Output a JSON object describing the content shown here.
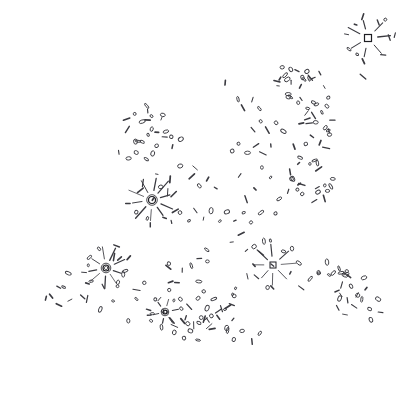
{
  "artwork": {
    "title": "Scattered Mark Field",
    "kind": "abstract-line-art",
    "width": 410,
    "height": 395,
    "background_color": "#ffffff",
    "stroke_color": "#3a3a40",
    "stroke_color_dark": "#1d1d22",
    "stroke_width": 0.9,
    "description": "Hand-drawn scattered field of small ellipses, dashes and dots forming a diagonal band from lower-left to upper-right, punctuated by five radial burst clusters."
  },
  "chart_data": {
    "type": "scatter",
    "xlabel": "",
    "ylabel": "",
    "xlim": [
      0,
      410
    ],
    "ylim": [
      0,
      395
    ],
    "grid": false,
    "legend": false,
    "bursts": [
      {
        "id": "burst-top-right",
        "cx": 368,
        "cy": 38,
        "rays": 7,
        "ray_len": 15,
        "core": "square",
        "core_size": 7
      },
      {
        "id": "burst-center-left",
        "cx": 152,
        "cy": 200,
        "rays": 10,
        "ray_len": 16,
        "core": "ring",
        "core_size": 7
      },
      {
        "id": "burst-lower-left",
        "cx": 106,
        "cy": 268,
        "rays": 9,
        "ray_len": 14,
        "core": "ring",
        "core_size": 6
      },
      {
        "id": "burst-lower-right",
        "cx": 273,
        "cy": 265,
        "rays": 8,
        "ray_len": 17,
        "core": "solid",
        "core_size": 6
      },
      {
        "id": "burst-small-bottom",
        "cx": 165,
        "cy": 312,
        "rays": 6,
        "ray_len": 7,
        "core": "ring",
        "core_size": 4
      }
    ],
    "clusters": [
      {
        "id": "cluster-upper-mid",
        "cx": 295,
        "cy": 85,
        "count": 16,
        "spread": 22
      },
      {
        "id": "cluster-upper-right-rings",
        "cx": 318,
        "cy": 118,
        "count": 10,
        "spread": 20
      },
      {
        "id": "cluster-left-mid",
        "cx": 145,
        "cy": 130,
        "count": 16,
        "spread": 30
      },
      {
        "id": "cluster-right-mid",
        "cx": 312,
        "cy": 175,
        "count": 14,
        "spread": 26
      },
      {
        "id": "cluster-bottom-mid",
        "cx": 195,
        "cy": 290,
        "count": 30,
        "spread": 42
      },
      {
        "id": "cluster-bottom-right",
        "cx": 338,
        "cy": 285,
        "count": 14,
        "spread": 24
      }
    ],
    "points": [
      [
        368,
        38
      ],
      [
        379,
        22
      ],
      [
        355,
        24
      ],
      [
        347,
        34
      ],
      [
        345,
        50
      ],
      [
        358,
        54
      ],
      [
        375,
        52
      ],
      [
        389,
        38
      ],
      [
        362,
        76
      ],
      [
        225,
        83
      ],
      [
        232,
        92
      ],
      [
        239,
        100
      ],
      [
        278,
        92
      ],
      [
        286,
        75
      ],
      [
        292,
        83
      ],
      [
        297,
        70
      ],
      [
        301,
        87
      ],
      [
        288,
        97
      ],
      [
        283,
        102
      ],
      [
        276,
        82
      ],
      [
        293,
        95
      ],
      [
        305,
        80
      ],
      [
        300,
        99
      ],
      [
        283,
        67
      ],
      [
        320,
        74
      ],
      [
        325,
        86
      ],
      [
        329,
        97
      ],
      [
        312,
        96
      ],
      [
        317,
        105
      ],
      [
        308,
        108
      ],
      [
        322,
        113
      ],
      [
        316,
        122
      ],
      [
        326,
        128
      ],
      [
        308,
        119
      ],
      [
        333,
        120
      ],
      [
        303,
        131
      ],
      [
        313,
        137
      ],
      [
        321,
        142
      ],
      [
        329,
        135
      ],
      [
        306,
        143
      ],
      [
        295,
        147
      ],
      [
        318,
        152
      ],
      [
        326,
        149
      ],
      [
        300,
        157
      ],
      [
        310,
        163
      ],
      [
        319,
        170
      ],
      [
        329,
        162
      ],
      [
        305,
        172
      ],
      [
        296,
        166
      ],
      [
        314,
        180
      ],
      [
        324,
        186
      ],
      [
        302,
        184
      ],
      [
        292,
        178
      ],
      [
        318,
        193
      ],
      [
        328,
        190
      ],
      [
        306,
        196
      ],
      [
        297,
        190
      ],
      [
        315,
        202
      ],
      [
        324,
        198
      ],
      [
        139,
        100
      ],
      [
        147,
        107
      ],
      [
        134,
        113
      ],
      [
        126,
        120
      ],
      [
        143,
        122
      ],
      [
        152,
        117
      ],
      [
        160,
        126
      ],
      [
        168,
        118
      ],
      [
        130,
        132
      ],
      [
        122,
        140
      ],
      [
        138,
        141
      ],
      [
        147,
        136
      ],
      [
        156,
        145
      ],
      [
        165,
        138
      ],
      [
        173,
        147
      ],
      [
        181,
        140
      ],
      [
        118,
        152
      ],
      [
        128,
        158
      ],
      [
        137,
        152
      ],
      [
        146,
        160
      ],
      [
        155,
        155
      ],
      [
        164,
        163
      ],
      [
        172,
        157
      ],
      [
        180,
        166
      ],
      [
        188,
        158
      ],
      [
        196,
        167
      ],
      [
        174,
        175
      ],
      [
        183,
        182
      ],
      [
        191,
        176
      ],
      [
        199,
        185
      ],
      [
        207,
        178
      ],
      [
        215,
        187
      ],
      [
        152,
        200
      ],
      [
        160,
        188
      ],
      [
        140,
        190
      ],
      [
        133,
        199
      ],
      [
        136,
        212
      ],
      [
        148,
        218
      ],
      [
        162,
        214
      ],
      [
        170,
        204
      ],
      [
        168,
        192
      ],
      [
        144,
        182
      ],
      [
        172,
        222
      ],
      [
        180,
        212
      ],
      [
        188,
        220
      ],
      [
        196,
        210
      ],
      [
        204,
        219
      ],
      [
        212,
        210
      ],
      [
        220,
        220
      ],
      [
        228,
        211
      ],
      [
        236,
        221
      ],
      [
        244,
        212
      ],
      [
        252,
        222
      ],
      [
        260,
        213
      ],
      [
        268,
        223
      ],
      [
        276,
        214
      ],
      [
        106,
        268
      ],
      [
        114,
        256
      ],
      [
        96,
        257
      ],
      [
        88,
        266
      ],
      [
        92,
        280
      ],
      [
        104,
        286
      ],
      [
        118,
        282
      ],
      [
        124,
        270
      ],
      [
        120,
        258
      ],
      [
        98,
        248
      ],
      [
        74,
        282
      ],
      [
        63,
        288
      ],
      [
        52,
        295
      ],
      [
        82,
        296
      ],
      [
        70,
        300
      ],
      [
        58,
        306
      ],
      [
        273,
        265
      ],
      [
        283,
        252
      ],
      [
        262,
        252
      ],
      [
        254,
        264
      ],
      [
        257,
        278
      ],
      [
        268,
        288
      ],
      [
        282,
        285
      ],
      [
        290,
        272
      ],
      [
        289,
        258
      ],
      [
        264,
        242
      ],
      [
        246,
        250
      ],
      [
        238,
        259
      ],
      [
        230,
        268
      ],
      [
        248,
        276
      ],
      [
        240,
        285
      ],
      [
        232,
        294
      ],
      [
        165,
        312
      ],
      [
        172,
        305
      ],
      [
        158,
        304
      ],
      [
        153,
        313
      ],
      [
        159,
        321
      ],
      [
        171,
        320
      ],
      [
        180,
        300
      ],
      [
        190,
        306
      ],
      [
        198,
        298
      ],
      [
        206,
        307
      ],
      [
        214,
        299
      ],
      [
        222,
        308
      ],
      [
        230,
        300
      ],
      [
        186,
        318
      ],
      [
        194,
        325
      ],
      [
        202,
        317
      ],
      [
        210,
        326
      ],
      [
        218,
        318
      ],
      [
        226,
        327
      ],
      [
        234,
        319
      ],
      [
        175,
        332
      ],
      [
        183,
        339
      ],
      [
        191,
        331
      ],
      [
        199,
        340
      ],
      [
        207,
        332
      ],
      [
        330,
        275
      ],
      [
        340,
        268
      ],
      [
        348,
        277
      ],
      [
        356,
        270
      ],
      [
        364,
        279
      ],
      [
        334,
        288
      ],
      [
        342,
        296
      ],
      [
        350,
        287
      ],
      [
        358,
        296
      ],
      [
        366,
        288
      ],
      [
        326,
        262
      ],
      [
        318,
        271
      ],
      [
        310,
        280
      ],
      [
        302,
        289
      ],
      [
        294,
        298
      ],
      [
        337,
        308
      ],
      [
        345,
        315
      ],
      [
        353,
        307
      ],
      [
        361,
        316
      ],
      [
        369,
        308
      ],
      [
        59,
        286
      ],
      [
        46,
        298
      ],
      [
        34,
        300
      ],
      [
        68,
        272
      ],
      [
        78,
        260
      ],
      [
        88,
        300
      ],
      [
        100,
        310
      ],
      [
        112,
        300
      ],
      [
        124,
        310
      ],
      [
        136,
        300
      ],
      [
        148,
        310
      ],
      [
        160,
        300
      ],
      [
        128,
        322
      ],
      [
        140,
        330
      ],
      [
        152,
        322
      ],
      [
        211,
        330
      ],
      [
        219,
        339
      ],
      [
        227,
        331
      ],
      [
        235,
        340
      ],
      [
        243,
        332
      ],
      [
        251,
        341
      ],
      [
        259,
        333
      ],
      [
        247,
        198
      ],
      [
        255,
        190
      ],
      [
        263,
        199
      ],
      [
        271,
        191
      ],
      [
        279,
        200
      ],
      [
        287,
        192
      ],
      [
        239,
        175
      ],
      [
        247,
        167
      ],
      [
        255,
        176
      ],
      [
        263,
        168
      ],
      [
        271,
        177
      ],
      [
        279,
        169
      ],
      [
        231,
        152
      ],
      [
        239,
        144
      ],
      [
        247,
        153
      ],
      [
        255,
        145
      ],
      [
        263,
        154
      ],
      [
        271,
        146
      ],
      [
        252,
        130
      ],
      [
        260,
        122
      ],
      [
        268,
        131
      ],
      [
        276,
        123
      ],
      [
        284,
        132
      ],
      [
        244,
        108
      ],
      [
        252,
        100
      ],
      [
        260,
        109
      ],
      [
        268,
        101
      ],
      [
        216,
        240
      ],
      [
        224,
        232
      ],
      [
        232,
        241
      ],
      [
        240,
        233
      ],
      [
        208,
        250
      ],
      [
        200,
        258
      ],
      [
        192,
        266
      ],
      [
        184,
        274
      ],
      [
        176,
        282
      ],
      [
        168,
        290
      ],
      [
        160,
        298
      ],
      [
        152,
        290
      ],
      [
        144,
        282
      ],
      [
        136,
        290
      ],
      [
        378,
        300
      ],
      [
        386,
        292
      ],
      [
        370,
        292
      ],
      [
        362,
        300
      ],
      [
        380,
        312
      ],
      [
        372,
        320
      ]
    ]
  }
}
